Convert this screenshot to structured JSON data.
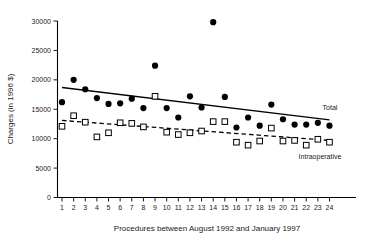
{
  "chart_data": {
    "type": "scatter",
    "title": "",
    "xlabel": "Procedures between August 1992 and January 1997",
    "ylabel": "Charges (in 1996 $)",
    "xlim": [
      0.3,
      24.7
    ],
    "ylim": [
      0,
      30000
    ],
    "grid": false,
    "legend_position": "inline-right",
    "x": [
      1,
      2,
      3,
      4,
      5,
      6,
      7,
      8,
      9,
      10,
      11,
      12,
      13,
      14,
      15,
      16,
      17,
      18,
      19,
      20,
      21,
      22,
      23,
      24
    ],
    "xticklabels": [
      "1",
      "2",
      "3",
      "4",
      "5",
      "6",
      "7",
      "8",
      "9",
      "10",
      "11",
      "12",
      "13",
      "14",
      "15",
      "16",
      "17",
      "18",
      "19",
      "20",
      "21",
      "22",
      "23",
      "24"
    ],
    "yticks": [
      0,
      5000,
      10000,
      15000,
      20000,
      25000,
      30000
    ],
    "yticklabels": [
      "0",
      "5000",
      "10000",
      "15000",
      "20000",
      "25000",
      "30000"
    ],
    "series": [
      {
        "name": "Total",
        "marker": "filled-circle",
        "line": "solid",
        "values": [
          16200,
          20000,
          18400,
          16900,
          15900,
          16000,
          16800,
          15200,
          22400,
          15200,
          13600,
          17200,
          15300,
          29800,
          17100,
          11900,
          13600,
          12200,
          15800,
          13300,
          12400,
          12400,
          12700,
          12200
        ],
        "trend": {
          "x0": 1,
          "y0": 18700,
          "x1": 24,
          "y1": 13200
        },
        "label_text": "Total"
      },
      {
        "name": "Intraoperative",
        "marker": "open-square",
        "line": "dashed",
        "values": [
          12100,
          13900,
          12800,
          10300,
          11000,
          12700,
          12600,
          12000,
          17200,
          11100,
          10700,
          11000,
          11300,
          12900,
          12900,
          9400,
          8900,
          9600,
          11800,
          9600,
          9700,
          8900,
          9900,
          9400
        ],
        "trend": {
          "x0": 1,
          "y0": 13100,
          "x1": 24,
          "y1": 9700
        },
        "label_text": "Intraoperative"
      }
    ]
  }
}
